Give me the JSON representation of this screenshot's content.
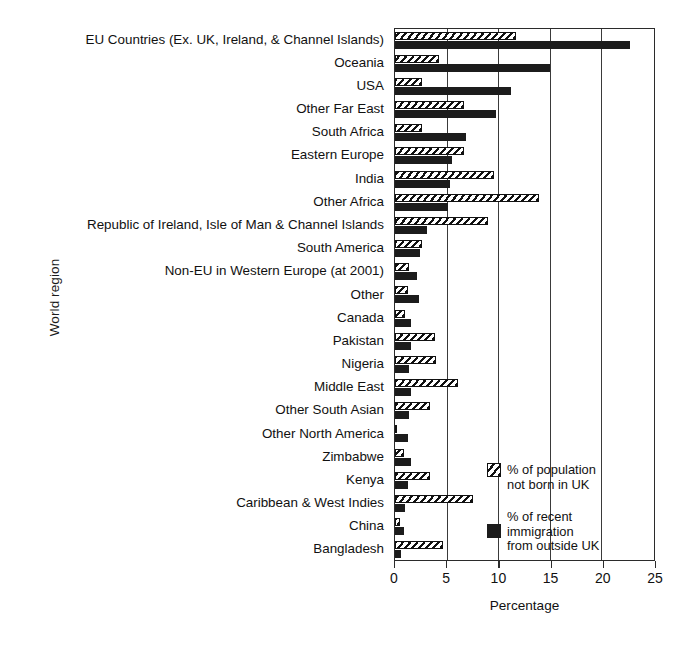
{
  "chart_data": {
    "type": "bar",
    "orientation": "horizontal",
    "title": "",
    "xlabel": "Percentage",
    "ylabel": "World region",
    "xlim": [
      0,
      25
    ],
    "xticks": [
      0,
      5,
      10,
      15,
      20,
      25
    ],
    "grid": "vertical gridlines at 5, 10, 15, 20",
    "legend_position": "inside lower right",
    "categories": [
      "EU Countries (Ex. UK, Ireland, & Channel Islands)",
      "Oceania",
      "USA",
      "Other Far East",
      "South Africa",
      "Eastern Europe",
      "India",
      "Other Africa",
      "Republic of Ireland, Isle of Man & Channel Islands",
      "South America",
      "Non-EU in Western Europe (at 2001)",
      "Other",
      "Canada",
      "Pakistan",
      "Nigeria",
      "Middle East",
      "Other South Asian",
      "Other North America",
      "Zimbabwe",
      "Kenya",
      "Caribbean & West Indies",
      "China",
      "Bangladesh"
    ],
    "series": [
      {
        "name": "% of population not born in UK",
        "style": "hatched",
        "values": [
          11.6,
          4.2,
          2.6,
          6.6,
          2.6,
          6.6,
          9.5,
          13.8,
          8.9,
          2.6,
          1.3,
          1.2,
          1.0,
          3.8,
          3.9,
          6.0,
          3.4,
          0.2,
          0.9,
          3.4,
          7.5,
          0.5,
          4.6
        ]
      },
      {
        "name": "% of recent immigration from outside UK",
        "style": "solid",
        "values": [
          22.5,
          14.8,
          11.1,
          9.7,
          6.8,
          5.5,
          5.3,
          5.1,
          3.1,
          2.4,
          2.1,
          2.3,
          1.5,
          1.5,
          1.3,
          1.5,
          1.3,
          1.2,
          1.5,
          1.2,
          1.0,
          0.9,
          0.6
        ]
      }
    ]
  },
  "legend": {
    "entries": [
      {
        "line1": "% of population",
        "line2": "not born in UK",
        "line3": ""
      },
      {
        "line1": "% of recent",
        "line2": "immigration",
        "line3": "from outside UK"
      }
    ]
  }
}
